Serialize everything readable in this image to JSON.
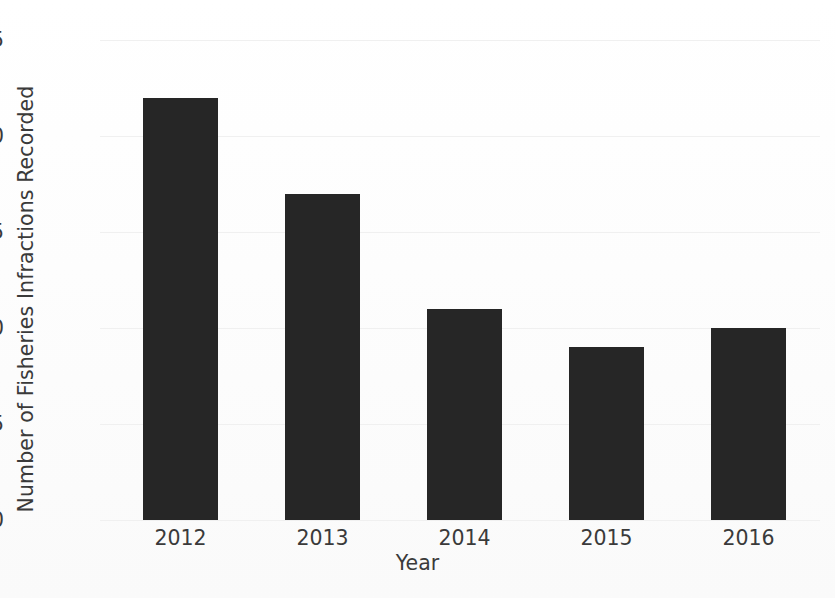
{
  "chart_data": {
    "type": "bar",
    "title": "",
    "categories": [
      "2012",
      "2013",
      "2014",
      "2015",
      "2016"
    ],
    "values": [
      22,
      17,
      11,
      9,
      10
    ],
    "xlabel": "Year",
    "ylabel": "Number of Fisheries Infractions Recorded",
    "ylim": [
      0,
      25
    ],
    "yticks": [
      0,
      5,
      10,
      15,
      20,
      25
    ],
    "ytick_labels": [
      "0",
      "5",
      "10",
      "15",
      "20",
      "25"
    ],
    "grid": true,
    "legend": null,
    "series": [
      {
        "name": "Fisheries Infractions Recorded",
        "values": [
          22,
          17,
          11,
          9,
          10
        ]
      }
    ],
    "colors": {
      "bar": "#262626",
      "background": "#fcfcfc",
      "gridline": "#f0f0f0",
      "text": "#3a3a3a"
    }
  }
}
